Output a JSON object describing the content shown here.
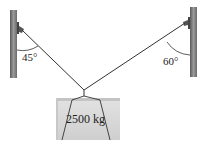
{
  "diagram": {
    "left_angle_label": "45°",
    "right_angle_label": "60°",
    "mass_label": "2500 kg",
    "colors": {
      "pole": "#8a8a8a",
      "pole_dark": "#555555",
      "rope": "#333333",
      "box_fill": "#d6d6d6",
      "box_edge": "#bdbdbd"
    }
  }
}
